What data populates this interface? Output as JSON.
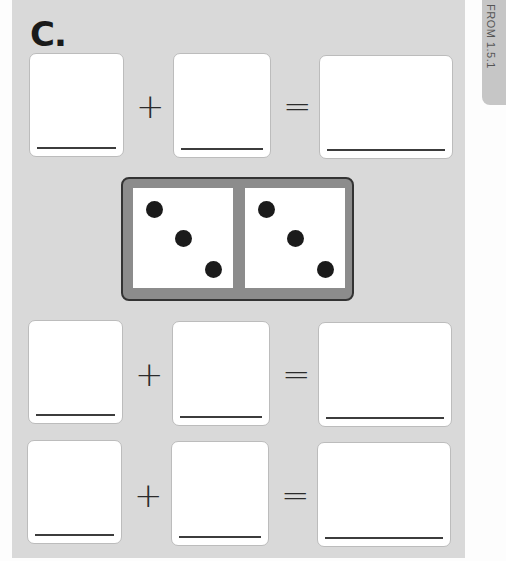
{
  "section_label": "C.",
  "side_tab": {
    "text": "FROM 1.5.1"
  },
  "equations": [
    {
      "plus": "+",
      "equals": "="
    },
    {
      "plus": "+",
      "equals": "="
    },
    {
      "plus": "+",
      "equals": "="
    }
  ],
  "domino": {
    "left_half_pips": 3,
    "right_half_pips": 3
  },
  "colors": {
    "panel": "#d9d9d9",
    "box": "#ffffff",
    "domino_frame": "#8c8c8c",
    "pip": "#1b1b1b"
  }
}
